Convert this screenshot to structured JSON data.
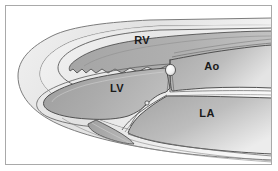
{
  "figure": {
    "view_description": "Schematic grayscale long-axis section of the heart",
    "frame_color": "#a9a9a9",
    "background_color": "#ffffff"
  },
  "palette": {
    "outline": "#3a3a3a",
    "myocardium_light": "#e8e8e8",
    "myocardium_mid": "#d2d2d2",
    "cavity_dark": "#9a9a9a",
    "cavity_mid": "#b4b4b4",
    "cavity_light": "#c9c9c9",
    "vegetation": "#f2f2f2",
    "label_color": "#1a1a1a"
  },
  "labels": [
    {
      "id": "rv",
      "text": "RV",
      "name": "right ventricle",
      "x": 142,
      "y": 44
    },
    {
      "id": "ao",
      "text": "Ao",
      "name": "aorta",
      "x": 212,
      "y": 70
    },
    {
      "id": "lv",
      "text": "LV",
      "name": "left ventricle",
      "x": 117,
      "y": 92
    },
    {
      "id": "la",
      "text": "LA",
      "name": "left atrium",
      "x": 207,
      "y": 117
    }
  ],
  "structures": [
    {
      "id": "epicardial-silhouette",
      "name": "heart silhouette"
    },
    {
      "id": "rv-cavity",
      "name": "right ventricular cavity"
    },
    {
      "id": "lv-cavity",
      "name": "left ventricular cavity"
    },
    {
      "id": "ao-root",
      "name": "aortic root and ascending aorta"
    },
    {
      "id": "la-cavity",
      "name": "left atrial cavity"
    },
    {
      "id": "aortic-valve-mass",
      "name": "aortic valve vegetation"
    },
    {
      "id": "mitral-valve-leaflets",
      "name": "mitral valve leaflets"
    },
    {
      "id": "inferior-recess",
      "name": "inferior pericardial recess"
    }
  ]
}
